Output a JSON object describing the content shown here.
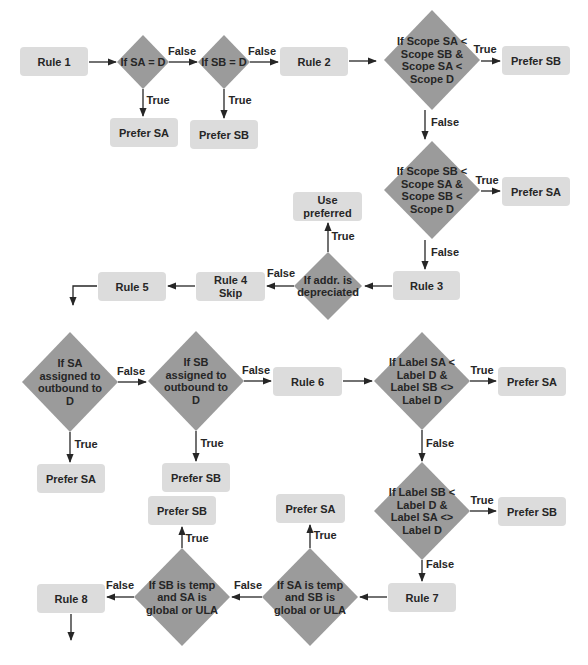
{
  "colors": {
    "box_fill": "#dcdcdc",
    "diamond_fill": "#9b9b9b",
    "line": "#262626",
    "text": "#262626",
    "background": "#ffffff"
  },
  "nodes": [
    {
      "id": "rule1",
      "type": "box",
      "x": 20,
      "y": 47,
      "w": 68,
      "h": 29,
      "lines": [
        "Rule 1"
      ]
    },
    {
      "id": "d-sa-eq-d",
      "type": "diamond",
      "cx": 143,
      "cy": 62,
      "rx": 26,
      "ry": 27,
      "lines": [
        "If SA = D"
      ]
    },
    {
      "id": "d-sb-eq-d",
      "type": "diamond",
      "cx": 224,
      "cy": 62,
      "rx": 26,
      "ry": 27,
      "lines": [
        "If SB = D"
      ]
    },
    {
      "id": "rule2",
      "type": "box",
      "x": 280,
      "y": 47,
      "w": 68,
      "h": 29,
      "lines": [
        "Rule 2"
      ]
    },
    {
      "id": "d-scope-sa",
      "type": "diamond",
      "cx": 432,
      "cy": 60,
      "rx": 48,
      "ry": 50,
      "lines": [
        "If Scope SA <",
        "Scope SB &",
        "Scope SA <",
        "Scope D"
      ]
    },
    {
      "id": "prefer-sb-1",
      "type": "box",
      "x": 502,
      "y": 46,
      "w": 68,
      "h": 29,
      "lines": [
        "Prefer SB"
      ]
    },
    {
      "id": "prefer-sa-r1",
      "type": "box",
      "x": 110,
      "y": 118,
      "w": 68,
      "h": 29,
      "lines": [
        "Prefer SA"
      ]
    },
    {
      "id": "prefer-sb-r1",
      "type": "box",
      "x": 190,
      "y": 120,
      "w": 68,
      "h": 29,
      "lines": [
        "Prefer SB"
      ]
    },
    {
      "id": "d-scope-sb",
      "type": "diamond",
      "cx": 432,
      "cy": 190,
      "rx": 48,
      "ry": 49,
      "lines": [
        "If Scope SB <",
        "Scope SA &",
        "Scope SB <",
        "Scope D"
      ]
    },
    {
      "id": "prefer-sa-2",
      "type": "box",
      "x": 502,
      "y": 177,
      "w": 68,
      "h": 29,
      "lines": [
        "Prefer SA"
      ]
    },
    {
      "id": "rule3",
      "type": "box",
      "x": 393,
      "y": 271,
      "w": 67,
      "h": 29,
      "lines": [
        "Rule 3"
      ]
    },
    {
      "id": "d-depreciated",
      "type": "diamond",
      "cx": 328,
      "cy": 286,
      "rx": 34,
      "ry": 34,
      "lines": [
        "If addr. is",
        "depreciated"
      ]
    },
    {
      "id": "use-preferred",
      "type": "box",
      "x": 293,
      "y": 192,
      "w": 69,
      "h": 29,
      "lines": [
        "Use",
        "preferred"
      ]
    },
    {
      "id": "rule4",
      "type": "box",
      "x": 196,
      "y": 272,
      "w": 69,
      "h": 29,
      "lines": [
        "Rule 4",
        "Skip"
      ]
    },
    {
      "id": "rule5",
      "type": "box",
      "x": 98,
      "y": 272,
      "w": 68,
      "h": 29,
      "lines": [
        "Rule 5"
      ]
    },
    {
      "id": "d-sa-outbound",
      "type": "diamond",
      "cx": 70,
      "cy": 382,
      "rx": 48,
      "ry": 50,
      "lines": [
        "If SA",
        "assigned to",
        "outbound to",
        "D"
      ]
    },
    {
      "id": "d-sb-outbound",
      "type": "diamond",
      "cx": 196,
      "cy": 381,
      "rx": 48,
      "ry": 50,
      "lines": [
        "If SB",
        "assigned to",
        "outbound to",
        "D"
      ]
    },
    {
      "id": "rule6",
      "type": "box",
      "x": 273,
      "y": 367,
      "w": 69,
      "h": 29,
      "lines": [
        "Rule 6"
      ]
    },
    {
      "id": "d-label-sa",
      "type": "diamond",
      "cx": 422,
      "cy": 381,
      "rx": 48,
      "ry": 49,
      "lines": [
        "If Label SA <",
        "Label D &",
        "Label SB <>",
        "Label D"
      ]
    },
    {
      "id": "prefer-sa-3",
      "type": "box",
      "x": 498,
      "y": 367,
      "w": 68,
      "h": 29,
      "lines": [
        "Prefer SA"
      ]
    },
    {
      "id": "prefer-sa-r3",
      "type": "box",
      "x": 37,
      "y": 464,
      "w": 68,
      "h": 29,
      "lines": [
        "Prefer SA"
      ]
    },
    {
      "id": "prefer-sb-r3",
      "type": "box",
      "x": 162,
      "y": 463,
      "w": 68,
      "h": 29,
      "lines": [
        "Prefer SB"
      ]
    },
    {
      "id": "d-label-sb",
      "type": "diamond",
      "cx": 422,
      "cy": 511,
      "rx": 48,
      "ry": 49,
      "lines": [
        "If Label SB <",
        "Label D &",
        "Label SA <>",
        "Label D"
      ]
    },
    {
      "id": "prefer-sb-4",
      "type": "box",
      "x": 498,
      "y": 497,
      "w": 68,
      "h": 29,
      "lines": [
        "Prefer SB"
      ]
    },
    {
      "id": "rule7",
      "type": "box",
      "x": 388,
      "y": 583,
      "w": 68,
      "h": 29,
      "lines": [
        "Rule 7"
      ]
    },
    {
      "id": "d-sa-temp",
      "type": "diamond",
      "cx": 310,
      "cy": 597,
      "rx": 48,
      "ry": 49,
      "lines": [
        "If SA  is temp",
        "and SB is",
        "global or ULA"
      ]
    },
    {
      "id": "prefer-sa-4",
      "type": "box",
      "x": 276,
      "y": 494,
      "w": 69,
      "h": 29,
      "lines": [
        "Prefer SA"
      ]
    },
    {
      "id": "d-sb-temp",
      "type": "diamond",
      "cx": 182,
      "cy": 597,
      "rx": 48,
      "ry": 49,
      "lines": [
        "If SB  is temp",
        "and SA is",
        "global or ULA"
      ]
    },
    {
      "id": "prefer-sb-5",
      "type": "box",
      "x": 148,
      "y": 496,
      "w": 68,
      "h": 29,
      "lines": [
        "Prefer SB"
      ]
    },
    {
      "id": "rule8",
      "type": "box",
      "x": 37,
      "y": 584,
      "w": 68,
      "h": 29,
      "lines": [
        "Rule 8"
      ]
    }
  ],
  "edges": [
    {
      "from": "rule1",
      "to": "d-sa-eq-d",
      "points": [
        [
          89,
          62
        ],
        [
          116,
          62
        ]
      ],
      "label": "",
      "lx": 0,
      "ly": 0
    },
    {
      "from": "d-sa-eq-d",
      "to": "d-sb-eq-d",
      "points": [
        [
          169,
          62
        ],
        [
          197,
          62
        ]
      ],
      "label": "False",
      "lx": 182,
      "ly": 55
    },
    {
      "from": "d-sa-eq-d",
      "to": "prefer-sa-r1",
      "points": [
        [
          143,
          89
        ],
        [
          143,
          116
        ]
      ],
      "label": "True",
      "lx": 158,
      "ly": 104
    },
    {
      "from": "d-sb-eq-d",
      "to": "rule2",
      "points": [
        [
          250,
          62
        ],
        [
          278,
          62
        ]
      ],
      "label": "False",
      "lx": 262,
      "ly": 55
    },
    {
      "from": "d-sb-eq-d",
      "to": "prefer-sb-r1",
      "points": [
        [
          224,
          89
        ],
        [
          224,
          118
        ]
      ],
      "label": "True",
      "lx": 240,
      "ly": 104
    },
    {
      "from": "rule2",
      "to": "d-scope-sa",
      "points": [
        [
          349,
          61
        ],
        [
          376,
          61
        ]
      ],
      "label": "",
      "lx": 0,
      "ly": 0
    },
    {
      "from": "d-scope-sa",
      "to": "prefer-sb-1",
      "points": [
        [
          481,
          61
        ],
        [
          500,
          61
        ]
      ],
      "label": "True",
      "lx": 485,
      "ly": 53
    },
    {
      "from": "d-scope-sa",
      "to": "d-scope-sb",
      "points": [
        [
          425,
          110
        ],
        [
          425,
          139
        ]
      ],
      "label": "False",
      "lx": 445,
      "ly": 126
    },
    {
      "from": "d-scope-sb",
      "to": "prefer-sa-2",
      "points": [
        [
          481,
          191
        ],
        [
          500,
          191
        ]
      ],
      "label": "True",
      "lx": 487,
      "ly": 184
    },
    {
      "from": "d-scope-sb",
      "to": "rule3",
      "points": [
        [
          425,
          240
        ],
        [
          425,
          269
        ]
      ],
      "label": "False",
      "lx": 445,
      "ly": 256
    },
    {
      "from": "rule3",
      "to": "d-depreciated",
      "points": [
        [
          392,
          286
        ],
        [
          365,
          286
        ]
      ],
      "label": "",
      "lx": 0,
      "ly": 0
    },
    {
      "from": "d-depreciated",
      "to": "use-preferred",
      "points": [
        [
          328,
          252
        ],
        [
          328,
          223
        ]
      ],
      "label": "True",
      "lx": 343,
      "ly": 240
    },
    {
      "from": "d-depreciated",
      "to": "rule4",
      "points": [
        [
          294,
          286
        ],
        [
          267,
          286
        ]
      ],
      "label": "False",
      "lx": 281,
      "ly": 277
    },
    {
      "from": "rule4",
      "to": "rule5",
      "points": [
        [
          195,
          286
        ],
        [
          168,
          286
        ]
      ],
      "label": "",
      "lx": 0,
      "ly": 0
    },
    {
      "from": "rule5",
      "to": "next",
      "points": [
        [
          97,
          286
        ],
        [
          73,
          286
        ],
        [
          73,
          305
        ]
      ],
      "label": "",
      "lx": 0,
      "ly": 0
    },
    {
      "from": "d-sa-outbound",
      "to": "d-sb-outbound",
      "points": [
        [
          118,
          382
        ],
        [
          146,
          382
        ]
      ],
      "label": "False",
      "lx": 131,
      "ly": 375
    },
    {
      "from": "d-sa-outbound",
      "to": "prefer-sa-r3",
      "points": [
        [
          70,
          432
        ],
        [
          70,
          462
        ]
      ],
      "label": "True",
      "lx": 86,
      "ly": 448
    },
    {
      "from": "d-sb-outbound",
      "to": "rule6",
      "points": [
        [
          244,
          381
        ],
        [
          271,
          381
        ]
      ],
      "label": "False",
      "lx": 256,
      "ly": 374
    },
    {
      "from": "d-sb-outbound",
      "to": "prefer-sb-r3",
      "points": [
        [
          196,
          431
        ],
        [
          196,
          461
        ]
      ],
      "label": "True",
      "lx": 212,
      "ly": 447
    },
    {
      "from": "rule6",
      "to": "d-label-sa",
      "points": [
        [
          343,
          381
        ],
        [
          372,
          381
        ]
      ],
      "label": "",
      "lx": 0,
      "ly": 0
    },
    {
      "from": "d-label-sa",
      "to": "prefer-sa-3",
      "points": [
        [
          470,
          381
        ],
        [
          496,
          381
        ]
      ],
      "label": "True",
      "lx": 482,
      "ly": 374
    },
    {
      "from": "d-label-sa",
      "to": "d-label-sb",
      "points": [
        [
          422,
          430
        ],
        [
          422,
          461
        ]
      ],
      "label": "False",
      "lx": 440,
      "ly": 447
    },
    {
      "from": "d-label-sb",
      "to": "prefer-sb-4",
      "points": [
        [
          470,
          511
        ],
        [
          496,
          511
        ]
      ],
      "label": "True",
      "lx": 482,
      "ly": 504
    },
    {
      "from": "d-label-sb",
      "to": "rule7",
      "points": [
        [
          422,
          560
        ],
        [
          422,
          581
        ]
      ],
      "label": "False",
      "lx": 440,
      "ly": 568
    },
    {
      "from": "rule7",
      "to": "d-sa-temp",
      "points": [
        [
          387,
          597
        ],
        [
          360,
          597
        ]
      ],
      "label": "",
      "lx": 0,
      "ly": 0
    },
    {
      "from": "d-sa-temp",
      "to": "prefer-sa-4",
      "points": [
        [
          310,
          548
        ],
        [
          310,
          525
        ]
      ],
      "label": "True",
      "lx": 325,
      "ly": 539
    },
    {
      "from": "d-sa-temp",
      "to": "d-sb-temp",
      "points": [
        [
          262,
          597
        ],
        [
          232,
          597
        ]
      ],
      "label": "False",
      "lx": 248,
      "ly": 589
    },
    {
      "from": "d-sb-temp",
      "to": "prefer-sb-5",
      "points": [
        [
          182,
          548
        ],
        [
          182,
          527
        ]
      ],
      "label": "True",
      "lx": 197,
      "ly": 542
    },
    {
      "from": "d-sb-temp",
      "to": "rule8",
      "points": [
        [
          134,
          597
        ],
        [
          107,
          597
        ]
      ],
      "label": "False",
      "lx": 120,
      "ly": 589
    },
    {
      "from": "rule8",
      "to": "next",
      "points": [
        [
          71,
          614
        ],
        [
          71,
          640
        ]
      ],
      "label": "",
      "lx": 0,
      "ly": 0
    }
  ]
}
